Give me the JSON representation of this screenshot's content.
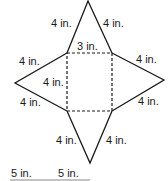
{
  "figure": {
    "type": "net of square pyramid",
    "base": {
      "shape": "square",
      "side_label": "3 in.",
      "style": "dashed"
    },
    "triangles": [
      {
        "position": "top",
        "left_edge": "4 in.",
        "right_edge": "4 in."
      },
      {
        "position": "left",
        "top_edge": "4 in.",
        "bottom_edge": "4 in.",
        "inner_label": "4 in."
      },
      {
        "position": "right",
        "top_edge": "4 in.",
        "bottom_edge": "4 in."
      },
      {
        "position": "bottom",
        "left_edge": "4 in.",
        "right_edge": "4 in."
      }
    ],
    "labels": {
      "top_left": "4 in.",
      "top_right": "4 in.",
      "base_top": "3 in.",
      "left_upper": "4 in.",
      "left_inner": "4 in.",
      "right_upper": "4 in.",
      "left_lower": "4 in.",
      "right_lower": "4 in.",
      "bottom_left": "4 in.",
      "bottom_right": "4 in.",
      "footer_1": "5 in.",
      "footer_2": "5 in."
    },
    "colors": {
      "line": "#1a1a1a",
      "background": "#ffffff"
    }
  }
}
